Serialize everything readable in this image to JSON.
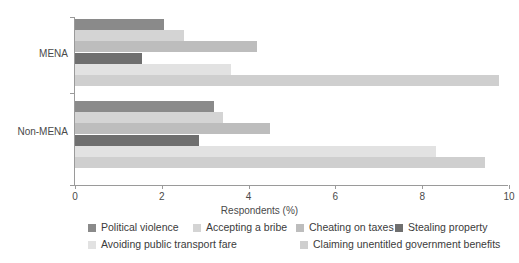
{
  "chart_data": {
    "type": "bar",
    "orientation": "horizontal",
    "grouped": true,
    "title": "",
    "xlabel": "Respondents (%)",
    "ylabel": "",
    "categories": [
      "MENA",
      "Non-MENA"
    ],
    "xlim": [
      0,
      10
    ],
    "xticks": [
      0,
      2,
      4,
      6,
      8,
      10
    ],
    "xtick_labels": [
      "0",
      "2",
      "4",
      "6",
      "8",
      "10"
    ],
    "grid": false,
    "legend_position": "bottom",
    "series": [
      {
        "name": "Political violence",
        "color": "#8a8a8a",
        "values": [
          2.05,
          3.2
        ]
      },
      {
        "name": "Accepting a bribe",
        "color": "#d4d4d4",
        "values": [
          2.5,
          3.4
        ]
      },
      {
        "name": "Cheating on taxes",
        "color": "#bdbdbd",
        "values": [
          4.2,
          4.5
        ]
      },
      {
        "name": "Stealing property",
        "color": "#6f6f6f",
        "values": [
          1.55,
          2.85
        ]
      },
      {
        "name": "Avoiding public transport fare",
        "color": "#e2e2e2",
        "values": [
          3.6,
          8.32
        ]
      },
      {
        "name": "Claiming unentitled government benefits",
        "color": "#cfcfcf",
        "values": [
          9.77,
          9.45
        ]
      }
    ]
  },
  "legend": {
    "row1": [
      {
        "label": "Political violence",
        "color": "#8a8a8a",
        "left": 88
      },
      {
        "label": "Accepting a bribe",
        "color": "#d4d4d4",
        "left": 193
      },
      {
        "label": "Cheating on taxes",
        "color": "#bdbdbd",
        "left": 296
      },
      {
        "label": "Stealing property",
        "color": "#6f6f6f",
        "left": 395
      }
    ],
    "row2": [
      {
        "label": "Avoiding public transport fare",
        "color": "#e2e2e2",
        "left": 88
      },
      {
        "label": "Claiming unentitled government benefits",
        "color": "#cfcfcf",
        "left": 300
      }
    ]
  },
  "axis": {
    "xlabel": "Respondents (%)",
    "ylabels": [
      {
        "text": "MENA",
        "top": 48
      },
      {
        "text": "Non-MENA",
        "top": 126
      }
    ]
  }
}
